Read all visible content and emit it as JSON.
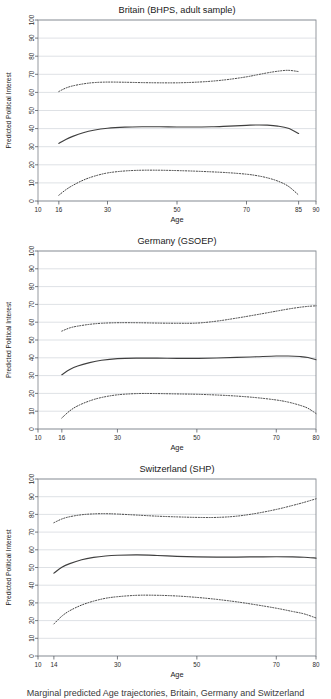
{
  "figure": {
    "caption": "Marginal predicted Age trajectories, Britain, Germany and Switzerland",
    "ylabel": "Predicted Political Interest",
    "xlabel": "Age",
    "line_color": "#3f3f3f",
    "grid_color": "#c8cdd4",
    "frame_color": "#8a8f96",
    "background": "#ffffff"
  },
  "chart_data": [
    {
      "type": "line",
      "title": "Britain (BHPS, adult sample)",
      "xlabel": "Age",
      "ylabel": "Predicted Political Interest",
      "xlim": [
        10,
        90
      ],
      "ylim": [
        0,
        100
      ],
      "xticks": [
        10,
        16,
        30,
        50,
        70,
        85,
        90
      ],
      "yticks": [
        0,
        10,
        20,
        30,
        40,
        50,
        60,
        70,
        80,
        90,
        100
      ],
      "grid": true,
      "legend": "none",
      "series": [
        {
          "name": "upper confidence bound",
          "style": "dotted",
          "x": [
            16,
            18,
            20,
            23,
            26,
            30,
            35,
            40,
            45,
            50,
            55,
            60,
            65,
            70,
            73,
            76,
            79,
            82,
            85
          ],
          "values": [
            60.5,
            62.4,
            63.6,
            64.7,
            65.4,
            65.7,
            65.6,
            65.4,
            65.3,
            65.3,
            65.6,
            66.2,
            67.2,
            68.6,
            69.7,
            70.8,
            71.7,
            72.2,
            71.5
          ]
        },
        {
          "name": "predicted mean",
          "style": "solid",
          "x": [
            16,
            18,
            20,
            23,
            26,
            30,
            35,
            40,
            45,
            50,
            55,
            60,
            65,
            70,
            73,
            76,
            79,
            82,
            85
          ],
          "values": [
            31.8,
            34.0,
            35.7,
            37.7,
            39.1,
            40.2,
            40.8,
            41.0,
            41.0,
            40.9,
            40.9,
            41.0,
            41.4,
            41.8,
            42.0,
            41.9,
            41.4,
            40.2,
            37.3
          ]
        },
        {
          "name": "lower confidence bound",
          "style": "dotted",
          "x": [
            16,
            18,
            20,
            23,
            26,
            30,
            35,
            40,
            45,
            50,
            55,
            60,
            65,
            70,
            73,
            76,
            79,
            82,
            85
          ],
          "values": [
            3.2,
            6.2,
            8.6,
            11.5,
            13.6,
            15.5,
            16.6,
            17.0,
            17.0,
            16.8,
            16.5,
            16.1,
            15.6,
            14.8,
            14.0,
            12.8,
            11.0,
            8.2,
            3.3
          ]
        }
      ]
    },
    {
      "type": "line",
      "title": "Germany (GSOEP)",
      "xlabel": "Age",
      "ylabel": "Predicted Political Interest",
      "xlim": [
        10,
        80
      ],
      "ylim": [
        0,
        100
      ],
      "xticks": [
        10,
        16,
        30,
        50,
        70,
        80
      ],
      "yticks": [
        0,
        10,
        20,
        30,
        40,
        50,
        60,
        70,
        80,
        90,
        100
      ],
      "grid": true,
      "legend": "none",
      "series": [
        {
          "name": "upper confidence bound",
          "style": "dotted",
          "x": [
            16,
            18,
            20,
            23,
            26,
            30,
            35,
            40,
            45,
            50,
            55,
            60,
            65,
            70,
            73,
            76,
            78,
            80
          ],
          "values": [
            55.0,
            56.8,
            57.8,
            58.8,
            59.4,
            59.7,
            59.7,
            59.5,
            59.4,
            59.5,
            60.6,
            62.3,
            64.2,
            66.2,
            67.4,
            68.4,
            68.9,
            69.2
          ]
        },
        {
          "name": "predicted mean",
          "style": "solid",
          "x": [
            16,
            18,
            20,
            23,
            26,
            30,
            35,
            40,
            45,
            50,
            55,
            60,
            65,
            70,
            73,
            76,
            78,
            80
          ],
          "values": [
            30.5,
            33.4,
            35.4,
            37.3,
            38.6,
            39.5,
            39.8,
            39.8,
            39.7,
            39.7,
            39.9,
            40.2,
            40.6,
            41.0,
            41.0,
            40.7,
            40.2,
            38.9
          ]
        },
        {
          "name": "lower confidence bound",
          "style": "dotted",
          "x": [
            16,
            18,
            20,
            23,
            26,
            30,
            35,
            40,
            45,
            50,
            55,
            60,
            65,
            70,
            73,
            76,
            78,
            80
          ],
          "values": [
            6.2,
            10.2,
            13.0,
            15.8,
            17.7,
            19.2,
            19.9,
            19.9,
            19.7,
            19.5,
            19.1,
            18.5,
            17.6,
            16.3,
            15.1,
            13.3,
            11.6,
            8.7
          ]
        }
      ]
    },
    {
      "type": "line",
      "title": "Switzerland (SHP)",
      "xlabel": "Age",
      "ylabel": "Predicted Political Interest",
      "xlim": [
        10,
        80
      ],
      "ylim": [
        0,
        100
      ],
      "xticks": [
        10,
        14,
        30,
        50,
        70,
        80
      ],
      "yticks": [
        0,
        10,
        20,
        30,
        40,
        50,
        60,
        70,
        80,
        90,
        100
      ],
      "grid": true,
      "legend": "none",
      "series": [
        {
          "name": "upper confidence bound",
          "style": "dotted",
          "x": [
            14,
            16,
            18,
            21,
            24,
            27,
            30,
            35,
            40,
            45,
            50,
            55,
            60,
            65,
            70,
            74,
            77,
            80
          ],
          "values": [
            75.3,
            77.4,
            78.7,
            79.8,
            80.3,
            80.4,
            80.2,
            79.6,
            79.0,
            78.6,
            78.3,
            78.3,
            79.0,
            80.6,
            82.8,
            85.0,
            86.8,
            88.8
          ]
        },
        {
          "name": "predicted mean",
          "style": "solid",
          "x": [
            14,
            16,
            18,
            21,
            24,
            27,
            30,
            35,
            40,
            45,
            50,
            55,
            60,
            65,
            70,
            74,
            77,
            80
          ],
          "values": [
            46.8,
            50.1,
            52.2,
            54.4,
            55.7,
            56.5,
            56.9,
            57.1,
            56.8,
            56.3,
            56.0,
            55.9,
            55.9,
            56.0,
            56.1,
            56.0,
            55.8,
            55.3
          ]
        },
        {
          "name": "lower confidence bound",
          "style": "dotted",
          "x": [
            14,
            16,
            18,
            21,
            24,
            27,
            30,
            35,
            40,
            45,
            50,
            55,
            60,
            65,
            70,
            74,
            77,
            80
          ],
          "values": [
            18.1,
            22.5,
            25.6,
            28.8,
            31.0,
            32.6,
            33.5,
            34.3,
            34.3,
            33.9,
            33.1,
            32.0,
            30.6,
            28.9,
            27.0,
            25.2,
            23.8,
            21.5
          ]
        }
      ]
    }
  ]
}
